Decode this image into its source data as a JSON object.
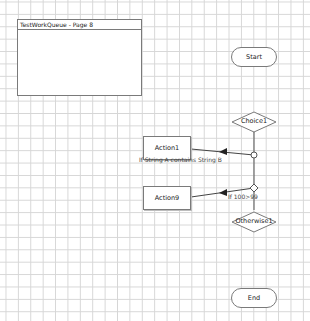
{
  "page_frame": {
    "title": "TestWorkQueue - Page 8"
  },
  "nodes": {
    "start": {
      "label": "Start",
      "type": "terminal"
    },
    "choice": {
      "label": "Choice1",
      "type": "decision"
    },
    "action1": {
      "label": "Action1",
      "type": "action"
    },
    "action9": {
      "label": "Action9",
      "type": "action"
    },
    "otherwise": {
      "label": "Otherwise1",
      "type": "decision"
    },
    "end": {
      "label": "End",
      "type": "terminal"
    }
  },
  "edges": {
    "choice_to_action1": {
      "label": "If String A contains String B"
    },
    "choice_to_action9": {
      "label": "If 100>99"
    }
  },
  "colors": {
    "grid": "#d6d6d6",
    "stroke": "#7a7a7a",
    "connector": "#333333"
  }
}
